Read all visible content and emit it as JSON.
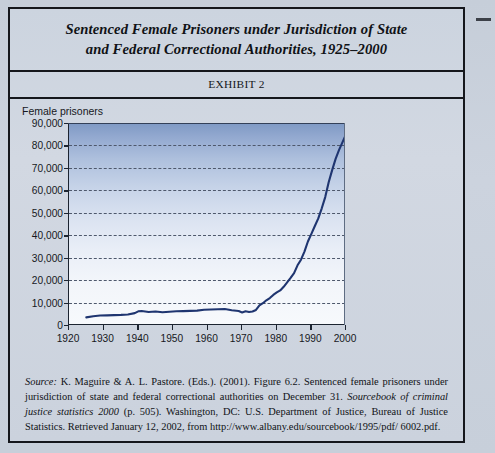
{
  "exhibit": {
    "title": "Sentenced Female Prisoners under Jurisdiction of State and Federal Correctional Authorities, 1925–2000",
    "title_line_1": "Sentenced Female Prisoners under Jurisdiction of State",
    "title_line_2": "and Federal Correctional Authorities, 1925–2000",
    "label": "EXHIBIT 2"
  },
  "source": {
    "label": "Source:",
    "text_part_1": " K. Maguire & A. L. Pastore. (Eds.). (2001). Figure 6.2. Sentenced female prisoners under jurisdiction of state and federal correctional authorities on December 31. ",
    "book_title": "Sourcebook of criminal justice statistics 2000",
    "text_part_2": " (p. 505). Washington, DC: U.S. Department of Justice, Bureau of Justice Statistics. Retrieved January 12, 2002, from http://www.albany.edu/sourcebook/1995/pdf/ 6002.pdf."
  },
  "chart_data": {
    "type": "line",
    "title": "Sentenced Female Prisoners under Jurisdiction of State and Federal Correctional Authorities, 1925–2000",
    "xlabel": "",
    "ylabel": "Female prisoners",
    "grid": true,
    "legend": false,
    "xlim": [
      1920,
      2000
    ],
    "ylim": [
      0,
      90000
    ],
    "xticks": [
      1920,
      1930,
      1940,
      1950,
      1960,
      1970,
      1980,
      1990,
      2000
    ],
    "xtick_labels": [
      "1920",
      "1930",
      "1940",
      "1950",
      "1960",
      "1970",
      "1980",
      "1990",
      "2000"
    ],
    "yticks": [
      0,
      10000,
      20000,
      30000,
      40000,
      50000,
      60000,
      70000,
      80000,
      90000
    ],
    "ytick_labels": [
      "0",
      "10,000",
      "20,000",
      "30,000",
      "40,000",
      "50,000",
      "60,000",
      "70,000",
      "80,000",
      "90,000"
    ],
    "line_color": "#1f3570",
    "series": [
      {
        "name": "Sentenced female prisoners",
        "x": [
          1925,
          1927,
          1929,
          1931,
          1933,
          1935,
          1937,
          1939,
          1940,
          1941,
          1942,
          1943,
          1944,
          1945,
          1947,
          1949,
          1951,
          1953,
          1955,
          1957,
          1959,
          1961,
          1963,
          1965,
          1967,
          1969,
          1970,
          1971,
          1972,
          1973,
          1974,
          1975,
          1976,
          1977,
          1978,
          1979,
          1980,
          1981,
          1982,
          1983,
          1984,
          1985,
          1986,
          1987,
          1988,
          1989,
          1990,
          1991,
          1992,
          1993,
          1994,
          1995,
          1996,
          1997,
          1998,
          1999,
          2000
        ],
        "values": [
          3400,
          3900,
          4200,
          4300,
          4400,
          4500,
          4700,
          5300,
          6100,
          6200,
          6000,
          5800,
          5900,
          6000,
          5700,
          5900,
          6100,
          6200,
          6300,
          6400,
          6800,
          6900,
          7000,
          7100,
          6600,
          6200,
          5600,
          6100,
          5800,
          6000,
          6700,
          8700,
          9700,
          11000,
          12000,
          13400,
          14500,
          15400,
          17000,
          19000,
          21000,
          23100,
          26600,
          29100,
          32700,
          37200,
          40600,
          44100,
          47500,
          52000,
          57000,
          63600,
          69000,
          74000,
          78000,
          81500,
          85000
        ]
      }
    ],
    "annotations": []
  }
}
